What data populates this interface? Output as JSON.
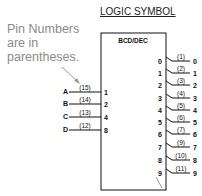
{
  "title": "LOGIC SYMBOL",
  "note": [
    "Pin Numbers",
    "are in",
    "parentheses."
  ],
  "block_label": "BCD/DEC",
  "inputs": [
    {
      "name": "A",
      "pin": "(15)",
      "weight": "1"
    },
    {
      "name": "B",
      "pin": "(14)",
      "weight": "2"
    },
    {
      "name": "C",
      "pin": "(13)",
      "weight": "4"
    },
    {
      "name": "D",
      "pin": "(12)",
      "weight": "8"
    }
  ],
  "outputs": [
    {
      "index": "0",
      "pin": "(1)",
      "name": "0"
    },
    {
      "index": "1",
      "pin": "(2)",
      "name": "1"
    },
    {
      "index": "2",
      "pin": "(3)",
      "name": "2"
    },
    {
      "index": "3",
      "pin": "(4)",
      "name": "3"
    },
    {
      "index": "4",
      "pin": "(5)",
      "name": "4"
    },
    {
      "index": "5",
      "pin": "(6)",
      "name": "5"
    },
    {
      "index": "6",
      "pin": "(7)",
      "name": "6"
    },
    {
      "index": "7",
      "pin": "(9)",
      "name": "7"
    },
    {
      "index": "8",
      "pin": "(10)",
      "name": "8"
    },
    {
      "index": "9",
      "pin": "(11)",
      "name": "9"
    }
  ]
}
